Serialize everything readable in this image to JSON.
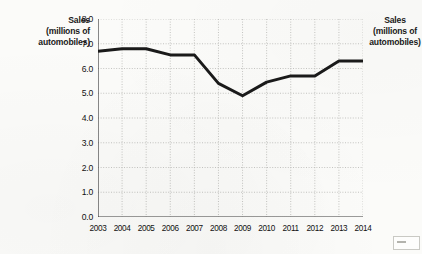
{
  "chart_data": {
    "type": "line",
    "title": "",
    "xlabel": "",
    "ylabel": "Sales (millions of automobiles)",
    "categories": [
      "2003",
      "2004",
      "2005",
      "2006",
      "2007",
      "2008",
      "2009",
      "2010",
      "2011",
      "2012",
      "2013",
      "2014"
    ],
    "values": [
      6.7,
      6.8,
      6.8,
      6.55,
      6.55,
      5.4,
      4.9,
      5.45,
      5.7,
      5.7,
      6.3,
      6.3
    ],
    "series": [
      {
        "name": "Sales",
        "values": [
          6.7,
          6.8,
          6.8,
          6.55,
          6.55,
          5.4,
          4.9,
          5.45,
          5.7,
          5.7,
          6.3,
          6.3
        ]
      }
    ],
    "ylim": [
      0.0,
      8.0
    ],
    "ytick_step": 1.0,
    "ytick_labels": [
      "8.0",
      "7.0",
      "6.0",
      "5.0",
      "4.0",
      "3.0",
      "2.0",
      "1.0",
      "0.0"
    ],
    "ytick_values": [
      8.0,
      7.0,
      6.0,
      5.0,
      4.0,
      3.0,
      2.0,
      1.0,
      0.0
    ],
    "xtick_labels": [
      "2003",
      "2004",
      "2005",
      "2006",
      "2007",
      "2008",
      "2009",
      "2010",
      "2011",
      "2012",
      "2013",
      "2014"
    ],
    "grid": true,
    "grid_style": "dotted",
    "legend": "none",
    "line_color": "#1a1a1a",
    "grid_color": "#b8b8b4",
    "axis_color": "#3a3a3a",
    "background_color": "#fbfbf9"
  },
  "axis_labels": {
    "left": {
      "line1": "Sales",
      "line2": "(millions of",
      "line3": "automobiles)"
    },
    "right": {
      "line1": "Sales",
      "line2": "(millions of",
      "line3": "automobiles)"
    }
  }
}
